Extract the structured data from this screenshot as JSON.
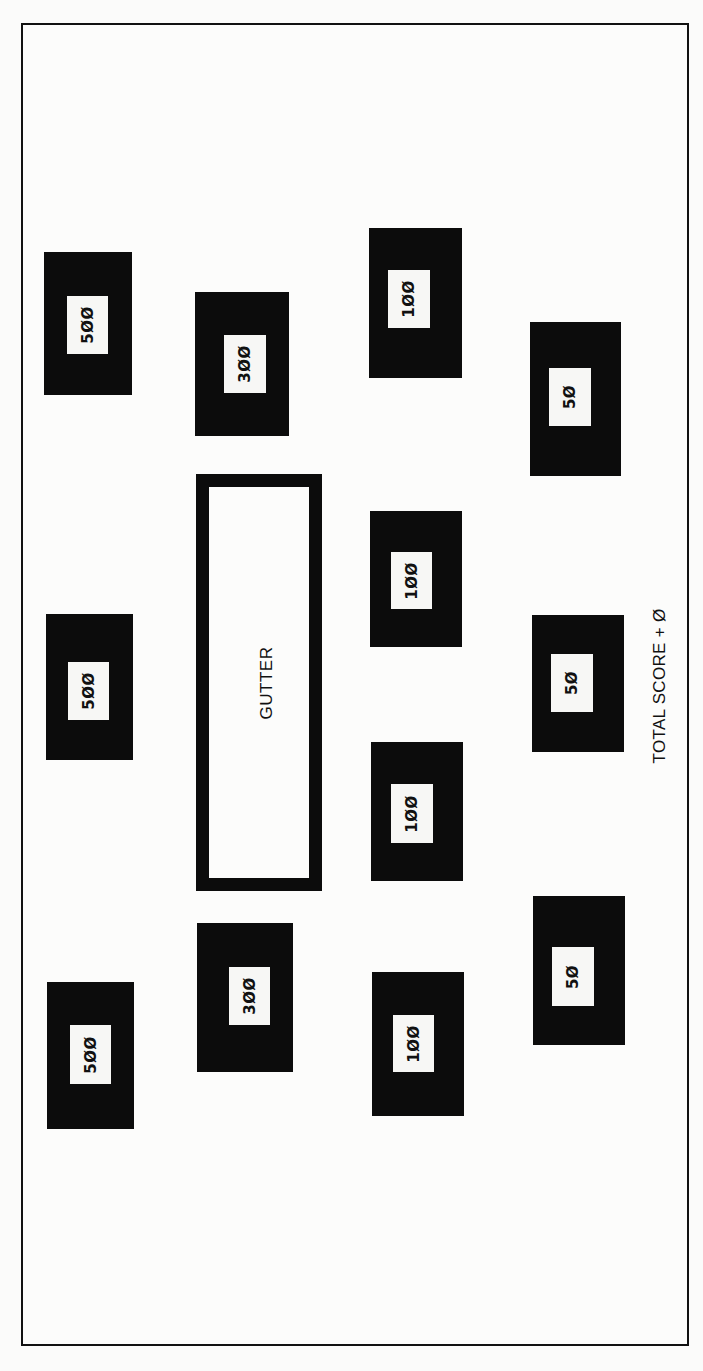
{
  "board": {
    "gutter": {
      "label": "GUTTER",
      "x": 196,
      "y": 474,
      "w": 126,
      "h": 417
    },
    "total_score": {
      "label": "TOTAL SCORE + Ø"
    },
    "colors": {
      "target": "#0c0c0c",
      "label_bg": "#f7f7f5",
      "frame": "#111111",
      "background": "#fcfcfb"
    },
    "targets": [
      {
        "value": "5ØØ",
        "points": 500,
        "x": 44,
        "y": 252,
        "w": 88,
        "h": 143,
        "lx": 67,
        "ly": 296,
        "lw": 41,
        "lh": 58
      },
      {
        "value": "3ØØ",
        "points": 300,
        "x": 195,
        "y": 292,
        "w": 94,
        "h": 144,
        "lx": 224,
        "ly": 335,
        "lw": 42,
        "lh": 58
      },
      {
        "value": "1ØØ",
        "points": 100,
        "x": 369,
        "y": 228,
        "w": 93,
        "h": 150,
        "lx": 388,
        "ly": 270,
        "lw": 42,
        "lh": 58
      },
      {
        "value": "5Ø",
        "points": 50,
        "x": 530,
        "y": 322,
        "w": 91,
        "h": 154,
        "lx": 549,
        "ly": 368,
        "lw": 42,
        "lh": 58
      },
      {
        "value": "5ØØ",
        "points": 500,
        "x": 46,
        "y": 614,
        "w": 87,
        "h": 146,
        "lx": 68,
        "ly": 662,
        "lw": 41,
        "lh": 58
      },
      {
        "value": "1ØØ",
        "points": 100,
        "x": 370,
        "y": 511,
        "w": 92,
        "h": 136,
        "lx": 391,
        "ly": 552,
        "lw": 41,
        "lh": 57
      },
      {
        "value": "5Ø",
        "points": 50,
        "x": 532,
        "y": 615,
        "w": 92,
        "h": 137,
        "lx": 551,
        "ly": 654,
        "lw": 42,
        "lh": 58
      },
      {
        "value": "1ØØ",
        "points": 100,
        "x": 371,
        "y": 742,
        "w": 92,
        "h": 139,
        "lx": 391,
        "ly": 784,
        "lw": 42,
        "lh": 59
      },
      {
        "value": "3ØØ",
        "points": 300,
        "x": 197,
        "y": 923,
        "w": 96,
        "h": 149,
        "lx": 229,
        "ly": 967,
        "lw": 41,
        "lh": 58
      },
      {
        "value": "5Ø",
        "points": 50,
        "x": 533,
        "y": 896,
        "w": 92,
        "h": 149,
        "lx": 552,
        "ly": 947,
        "lw": 42,
        "lh": 59
      },
      {
        "value": "5ØØ",
        "points": 500,
        "x": 47,
        "y": 982,
        "w": 87,
        "h": 147,
        "lx": 70,
        "ly": 1025,
        "lw": 41,
        "lh": 59
      },
      {
        "value": "1ØØ",
        "points": 100,
        "x": 372,
        "y": 972,
        "w": 92,
        "h": 144,
        "lx": 393,
        "ly": 1015,
        "lw": 41,
        "lh": 57
      }
    ]
  }
}
